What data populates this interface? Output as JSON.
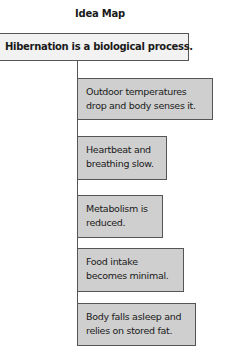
{
  "title": "Idea Map",
  "root": {
    "label": "Hibernation is a biological process."
  },
  "nodes": [
    {
      "line1": "Outdoor temperatures",
      "line2": "drop and body senses it."
    },
    {
      "line1": "Heartbeat and",
      "line2": "breathing slow."
    },
    {
      "line1": "Metabolism is",
      "line2": "reduced."
    },
    {
      "line1": "Food intake",
      "line2": "becomes minimal."
    },
    {
      "line1": "Body falls asleep and",
      "line2": "relies on stored fat."
    }
  ],
  "colors": {
    "root_fill": "#f2f2f2",
    "node_fill": "#cfcfcf",
    "border": "#555555"
  }
}
